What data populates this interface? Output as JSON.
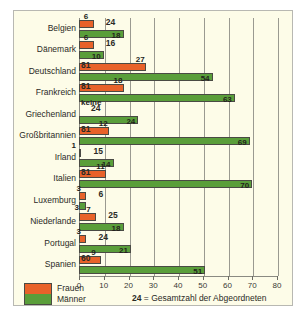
{
  "chart_data": {
    "type": "bar",
    "orientation": "horizontal",
    "title": "",
    "xlabel": "",
    "ylabel": "",
    "xlim": [
      0,
      80
    ],
    "xticks": [
      0,
      10,
      20,
      30,
      40,
      50,
      60,
      70,
      80
    ],
    "grid": true,
    "legend_position": "bottom-left",
    "categories": [
      "Belgien",
      "Dänemark",
      "Deutschland",
      "Frankreich",
      "Griechenland",
      "Großbritannien",
      "Irland",
      "Italien",
      "Luxemburg",
      "Niederlande",
      "Portugal",
      "Spanien"
    ],
    "series": [
      {
        "name": "Frauen",
        "color": "#e8622a",
        "values": [
          6,
          6,
          27,
          18,
          0,
          12,
          1,
          11,
          3,
          7,
          3,
          9
        ],
        "labels": [
          "6",
          "6",
          "27",
          "18",
          "keine",
          "12",
          "1",
          "11",
          "3",
          "7",
          "3",
          "9"
        ]
      },
      {
        "name": "Männer",
        "color": "#5a9e3a",
        "values": [
          18,
          10,
          54,
          63,
          24,
          69,
          14,
          70,
          3,
          18,
          21,
          51
        ],
        "labels": [
          "18",
          "10",
          "54",
          "63",
          "24",
          "69",
          "14",
          "70",
          "3",
          "18",
          "21",
          "51"
        ]
      }
    ],
    "totals": [
      24,
      16,
      81,
      81,
      24,
      81,
      15,
      81,
      6,
      25,
      24,
      60
    ],
    "totals_labels": [
      "24",
      "16",
      "81",
      "81",
      "24",
      "81",
      "15",
      "81",
      "6",
      "25",
      "24",
      "60"
    ]
  },
  "legend": {
    "women_label": "Frauen",
    "men_label": "Männer",
    "note_value": "24",
    "note_text": "= Gesamtzahl der Abgeordneten"
  }
}
